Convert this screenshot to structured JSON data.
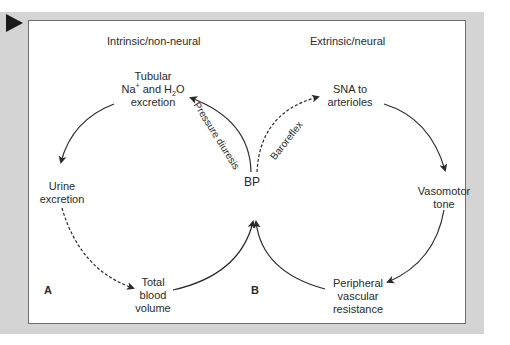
{
  "diagram": {
    "headers": {
      "left": "Intrinsic/non-neural",
      "right": "Extrinsic/neural"
    },
    "center_node": "BP",
    "nodes": {
      "tubular": {
        "line1": "Tubular",
        "line2_a": "Na",
        "line2_sup": "+",
        "line2_b": " and H",
        "line2_sub": "2",
        "line2_c": "O",
        "line3": "excretion"
      },
      "urine": {
        "line1": "Urine",
        "line2": "excretion"
      },
      "blood_volume": {
        "line1": "Total",
        "line2": "blood",
        "line3": "volume"
      },
      "sna": {
        "line1": "SNA to",
        "line2": "arterioles"
      },
      "vasomotor": {
        "line1": "Vasomotor",
        "line2": "tone"
      },
      "pvr": {
        "line1": "Peripheral",
        "line2": "vascular",
        "line3": "resistance"
      }
    },
    "edge_labels": {
      "pressure_diuresis": "Pressure diuresis",
      "baroreflex": "Baroreflex"
    },
    "panel_labels": {
      "a": "A",
      "b": "B"
    },
    "colors": {
      "frame": "#d4d4d4",
      "line": "#2a2a2a",
      "border": "#6f6f6f"
    }
  }
}
